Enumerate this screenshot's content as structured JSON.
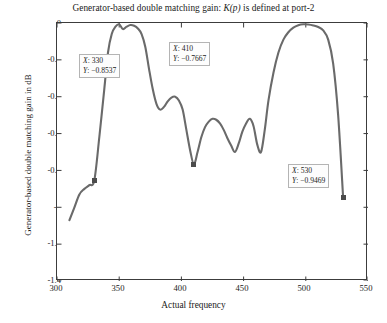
{
  "chart_data": {
    "type": "line",
    "title": "Generator-based double matching gain: K(p) is defined at port-2",
    "title_plain": "Generator-based double matching gain: ",
    "title_italic": "K(p)",
    "title_tail": " is defined at port-2",
    "xlabel": "Actual frequency",
    "ylabel": "Generator-based double matching gain in dB",
    "xlim": [
      300,
      550
    ],
    "ylim": [
      -1.4,
      0
    ],
    "xticks": [
      300,
      350,
      400,
      450,
      500,
      550
    ],
    "yticks": [
      0,
      -0.2,
      -0.4,
      -0.6,
      -0.8,
      -1,
      -1.2,
      -1.4
    ],
    "xtick_labels": [
      "300",
      "350",
      "400",
      "450",
      "500",
      "550"
    ],
    "ytick_labels": [
      "0",
      "-0.2",
      "-0.4",
      "-0.6",
      "-0.8",
      "-1",
      "-1.2",
      "-1.4"
    ],
    "grid": false,
    "legend": null,
    "line_color": "#6a6a6a",
    "line_width": 2.1,
    "series": [
      {
        "name": "Generator-based double matching gain",
        "x": [
          310,
          314,
          318,
          322,
          326,
          330,
          334,
          338,
          341,
          344,
          347,
          350,
          353,
          356,
          359,
          362,
          365,
          368,
          371,
          374,
          377,
          380,
          383,
          386,
          389,
          392,
          395,
          398,
          401,
          404,
          407,
          410,
          413,
          416,
          419,
          422,
          425,
          428,
          431,
          434,
          437,
          440,
          443,
          446,
          449,
          452,
          455,
          458,
          461,
          464,
          467,
          470,
          474,
          478,
          482,
          486,
          490,
          494,
          498,
          502,
          506,
          510,
          514,
          518,
          522,
          526,
          530
        ],
        "y": [
          -1.07,
          -1.0,
          -0.93,
          -0.9,
          -0.88,
          -0.8537,
          -0.62,
          -0.36,
          -0.16,
          -0.06,
          -0.02,
          -0.007,
          -0.033,
          -0.02,
          -0.011,
          -0.015,
          -0.03,
          -0.06,
          -0.13,
          -0.25,
          -0.36,
          -0.44,
          -0.47,
          -0.455,
          -0.425,
          -0.405,
          -0.4,
          -0.42,
          -0.47,
          -0.58,
          -0.69,
          -0.7667,
          -0.7,
          -0.62,
          -0.565,
          -0.535,
          -0.52,
          -0.525,
          -0.545,
          -0.58,
          -0.625,
          -0.665,
          -0.7,
          -0.655,
          -0.59,
          -0.545,
          -0.52,
          -0.56,
          -0.66,
          -0.7,
          -0.58,
          -0.42,
          -0.27,
          -0.16,
          -0.09,
          -0.05,
          -0.025,
          -0.012,
          -0.007,
          -0.008,
          -0.013,
          -0.022,
          -0.04,
          -0.09,
          -0.22,
          -0.5,
          -0.9469
        ]
      }
    ],
    "annotations": [
      {
        "id": "datatip-1",
        "x_label": "X: 330",
        "y_label": "Y: -0.8537",
        "x_name": "X",
        "y_name": "Y",
        "x_value": "330",
        "y_value": "−0.8537",
        "point_x": 330,
        "point_y": -0.8537
      },
      {
        "id": "datatip-2",
        "x_label": "X: 410",
        "y_label": "Y: -0.7667",
        "x_name": "X",
        "y_name": "Y",
        "x_value": "410",
        "y_value": "−0.7667",
        "point_x": 410,
        "point_y": -0.7667
      },
      {
        "id": "datatip-3",
        "x_label": "X: 530",
        "y_label": "Y: -0.9469",
        "x_name": "X",
        "y_name": "Y",
        "x_value": "530",
        "y_value": "−0.9469",
        "point_x": 530,
        "point_y": -0.9469
      }
    ]
  }
}
